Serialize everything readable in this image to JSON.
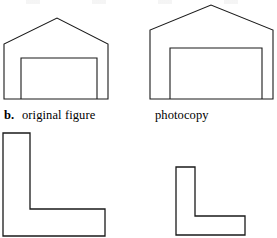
{
  "figure": {
    "part_label": "b.",
    "left_caption": "original figure",
    "right_caption": "photocopy",
    "stroke_color": "#1a1a1a",
    "fill_color": "#ffffff",
    "background_color": "#ffffff",
    "canvas": {
      "width": 277,
      "height": 238
    }
  },
  "shapes": {
    "house_original": {
      "name": "house-outline-original",
      "outline_points": "4,99 4,44 57,18 108,44 108,99",
      "door_points": "21,99 21,58 97,58 97,99",
      "stroke_width": 1.1
    },
    "house_photocopy": {
      "name": "house-outline-photocopy",
      "outline_points": "150,99 150,30 211,5 273,30 273,99",
      "door_points": "170,99 170,48 262,48 262,99",
      "stroke_width": 1.1
    },
    "ell_original": {
      "name": "l-shape-original",
      "points": "3,133 30,133 30,209 105,209 105,236 3,236",
      "stroke_width": 1.3
    },
    "ell_photocopy": {
      "name": "l-shape-photocopy",
      "points": "176,167 195,167 195,216 245,216 245,235 176,235",
      "stroke_width": 1.3
    }
  }
}
